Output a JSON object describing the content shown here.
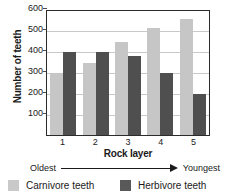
{
  "chart_data": {
    "type": "bar",
    "title": "",
    "xlabel": "Rock layer",
    "ylabel": "Number of teeth",
    "categories": [
      "1",
      "2",
      "3",
      "4",
      "5"
    ],
    "series": [
      {
        "name": "Carnivore teeth",
        "color": "#c6c6c6",
        "values": [
          300,
          350,
          450,
          520,
          560
        ]
      },
      {
        "name": "Herbivore teeth",
        "color": "#4f4f4f",
        "values": [
          400,
          400,
          380,
          300,
          200
        ]
      }
    ],
    "ylim": [
      0,
      600
    ],
    "yticks": [
      600,
      500,
      400,
      300,
      200,
      100
    ],
    "grid": true,
    "legend_position": "bottom",
    "annotations": {
      "axis_start_label": "Oldest",
      "axis_end_label": "Youngest",
      "arrow_icon": "right-arrow-icon"
    }
  },
  "legend": {
    "items": [
      {
        "label": "Carnivore teeth",
        "swatch": "light-gray-swatch"
      },
      {
        "label": "Herbivore teeth",
        "swatch": "dark-gray-swatch"
      }
    ]
  }
}
